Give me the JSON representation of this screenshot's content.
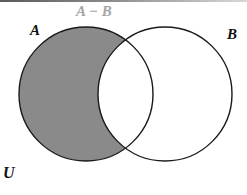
{
  "diagram": {
    "type": "venn",
    "title": "A − B",
    "universe_label": "U",
    "sets": [
      {
        "id": "A",
        "label": "A",
        "cx": 86,
        "cy": 94,
        "r": 67
      },
      {
        "id": "B",
        "label": "B",
        "cx": 165,
        "cy": 94,
        "r": 67
      }
    ],
    "shaded_region": "A − B",
    "colors": {
      "shade": "#8a8a8a",
      "outline": "#1a1a1a",
      "title": "#a6a6a6",
      "labels": "#111111",
      "background": "#ffffff"
    }
  }
}
